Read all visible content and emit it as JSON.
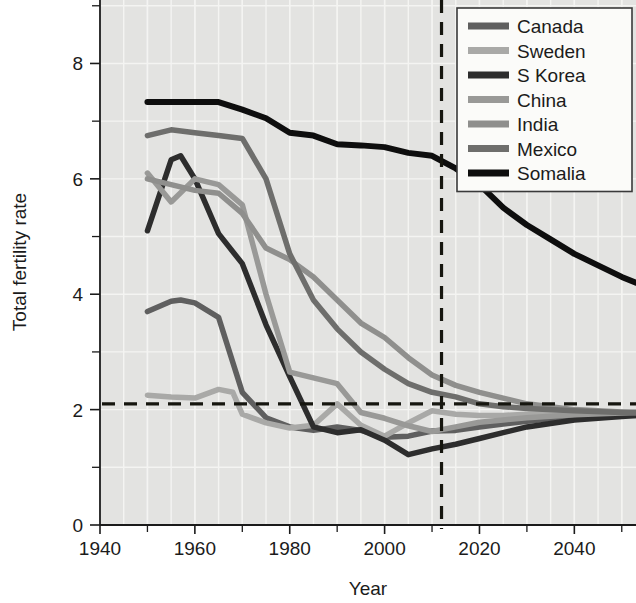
{
  "chart_data": {
    "type": "line",
    "title": "",
    "xlabel": "Year",
    "ylabel": "Total fertility rate",
    "xlim": [
      1940,
      2053
    ],
    "ylim": [
      0,
      9.1
    ],
    "xticks": [
      1940,
      1950,
      1960,
      1970,
      1980,
      1990,
      2000,
      2010,
      2020,
      2030,
      2040,
      2050
    ],
    "xtick_labels": [
      "1940",
      "",
      "1960",
      "",
      "1980",
      "",
      "2000",
      "",
      "2020",
      "",
      "2040",
      ""
    ],
    "x_major_labels": [
      "1940",
      "1960",
      "1980",
      "2000",
      "2020",
      "2040"
    ],
    "yticks": [
      0,
      1,
      2,
      3,
      4,
      5,
      6,
      7,
      8,
      9
    ],
    "ytick_labels": [
      "0",
      "",
      "2",
      "",
      "4",
      "",
      "6",
      "",
      "8",
      ""
    ],
    "y_major_labels": [
      "0",
      "2",
      "4",
      "6",
      "8"
    ],
    "grid": true,
    "grid_color": "#f4f4f2",
    "plot_background": "#e3e3e1",
    "legend_position": "top-right",
    "annotations": [
      {
        "name": "replacement-rate-line",
        "type": "hline",
        "value": 2.1,
        "style": "dashed",
        "color": "#16160f"
      },
      {
        "name": "present-year-line",
        "type": "vline",
        "value": 2012,
        "style": "dashed",
        "color": "#16160f"
      }
    ],
    "series": [
      {
        "name": "Canada",
        "color": "#5f5f5f",
        "x": [
          1950,
          1955,
          1957,
          1960,
          1965,
          1970,
          1975,
          1980,
          1985,
          1990,
          1995,
          2000,
          2005,
          2010,
          2015,
          2020,
          2025,
          2030,
          2035,
          2040,
          2045,
          2050,
          2053
        ],
        "values": [
          3.7,
          3.88,
          3.9,
          3.85,
          3.6,
          2.3,
          1.86,
          1.7,
          1.64,
          1.7,
          1.64,
          1.52,
          1.54,
          1.63,
          1.64,
          1.7,
          1.75,
          1.8,
          1.84,
          1.87,
          1.89,
          1.9,
          1.9
        ]
      },
      {
        "name": "Sweden",
        "color": "#a9a9a7",
        "x": [
          1950,
          1955,
          1960,
          1965,
          1968,
          1970,
          1975,
          1980,
          1985,
          1990,
          1995,
          2000,
          2005,
          2010,
          2015,
          2020,
          2025,
          2030,
          2040,
          2050,
          2053
        ],
        "values": [
          2.25,
          2.22,
          2.2,
          2.35,
          2.3,
          1.92,
          1.77,
          1.68,
          1.73,
          2.1,
          1.73,
          1.54,
          1.77,
          1.98,
          1.92,
          1.9,
          1.9,
          1.92,
          1.94,
          1.95,
          1.95
        ]
      },
      {
        "name": "S Korea",
        "color": "#2d2d2d",
        "x": [
          1950,
          1955,
          1957,
          1960,
          1965,
          1970,
          1975,
          1980,
          1985,
          1990,
          1995,
          2000,
          2005,
          2010,
          2015,
          2020,
          2025,
          2030,
          2040,
          2050,
          2053
        ],
        "values": [
          5.1,
          6.33,
          6.4,
          6.0,
          5.05,
          4.53,
          3.47,
          2.57,
          1.7,
          1.6,
          1.65,
          1.47,
          1.22,
          1.32,
          1.4,
          1.5,
          1.6,
          1.7,
          1.82,
          1.88,
          1.9
        ]
      },
      {
        "name": "China",
        "color": "#999997",
        "x": [
          1950,
          1955,
          1960,
          1965,
          1970,
          1975,
          1980,
          1985,
          1990,
          1995,
          2000,
          2005,
          2010,
          2015,
          2020,
          2025,
          2030,
          2040,
          2050,
          2053
        ],
        "values": [
          6.1,
          5.6,
          6.0,
          5.9,
          5.55,
          4.0,
          2.65,
          2.55,
          2.45,
          1.95,
          1.85,
          1.72,
          1.62,
          1.7,
          1.78,
          1.82,
          1.86,
          1.91,
          1.94,
          1.95
        ]
      },
      {
        "name": "India",
        "color": "#8f8f8d",
        "x": [
          1950,
          1955,
          1960,
          1965,
          1970,
          1975,
          1980,
          1985,
          1990,
          1995,
          2000,
          2005,
          2010,
          2015,
          2020,
          2025,
          2030,
          2035,
          2040,
          2050,
          2053
        ],
        "values": [
          6.0,
          5.9,
          5.8,
          5.75,
          5.4,
          4.8,
          4.6,
          4.3,
          3.9,
          3.5,
          3.25,
          2.9,
          2.6,
          2.42,
          2.3,
          2.2,
          2.1,
          2.05,
          2.0,
          1.96,
          1.95
        ]
      },
      {
        "name": "Mexico",
        "color": "#6e6e6c",
        "x": [
          1950,
          1955,
          1960,
          1965,
          1970,
          1975,
          1980,
          1985,
          1990,
          1995,
          2000,
          2005,
          2010,
          2015,
          2020,
          2025,
          2030,
          2040,
          2050,
          2053
        ],
        "values": [
          6.75,
          6.85,
          6.8,
          6.75,
          6.7,
          6.0,
          4.7,
          3.9,
          3.4,
          3.0,
          2.7,
          2.45,
          2.3,
          2.22,
          2.1,
          2.05,
          2.02,
          1.98,
          1.95,
          1.95
        ]
      },
      {
        "name": "Somalia",
        "color": "#0e0e0e",
        "x": [
          1950,
          1955,
          1960,
          1965,
          1970,
          1975,
          1980,
          1985,
          1990,
          1995,
          2000,
          2005,
          2010,
          2015,
          2020,
          2025,
          2030,
          2035,
          2040,
          2045,
          2050,
          2053
        ],
        "values": [
          7.33,
          7.33,
          7.33,
          7.33,
          7.2,
          7.05,
          6.8,
          6.75,
          6.6,
          6.58,
          6.55,
          6.45,
          6.4,
          6.18,
          5.9,
          5.5,
          5.2,
          4.95,
          4.7,
          4.5,
          4.3,
          4.2
        ]
      }
    ]
  },
  "axes": {
    "y_title": "Total fertility rate",
    "x_title": "Year"
  },
  "legend": {
    "items": [
      {
        "label": "Canada",
        "color": "#5f5f5f"
      },
      {
        "label": "Sweden",
        "color": "#a9a9a7"
      },
      {
        "label": "S Korea",
        "color": "#2d2d2d"
      },
      {
        "label": "China",
        "color": "#999997"
      },
      {
        "label": "India",
        "color": "#8f8f8d"
      },
      {
        "label": "Mexico",
        "color": "#6e6e6c"
      },
      {
        "label": "Somalia",
        "color": "#0e0e0e"
      }
    ]
  }
}
